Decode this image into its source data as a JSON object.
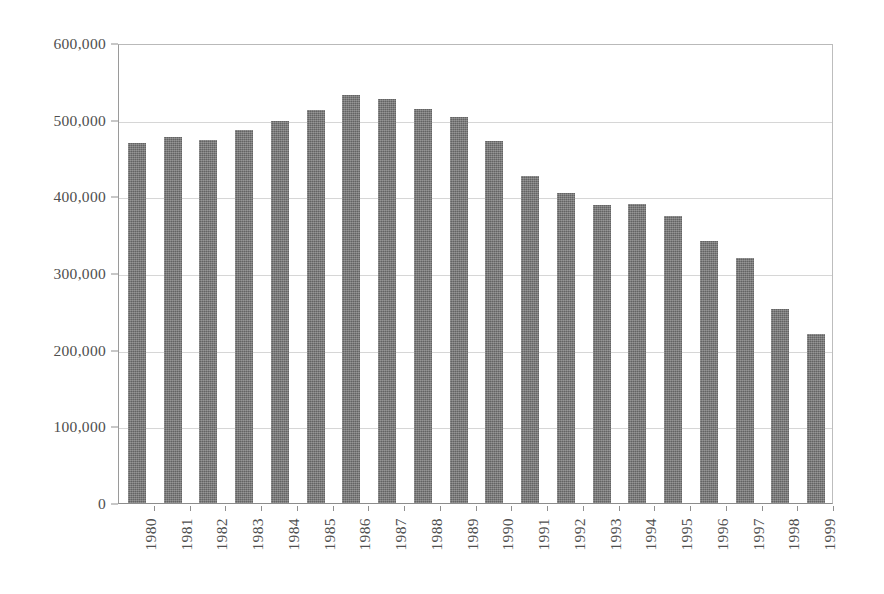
{
  "chart_data": {
    "type": "bar",
    "title": "",
    "subtitle": "",
    "xlabel": "",
    "ylabel": "",
    "categories": [
      "1980",
      "1981",
      "1982",
      "1983",
      "1984",
      "1985",
      "1986",
      "1987",
      "1988",
      "1989",
      "1990",
      "1991",
      "1992",
      "1993",
      "1994",
      "1995",
      "1996",
      "1997",
      "1998",
      "1999"
    ],
    "values": [
      470000,
      477000,
      474000,
      487000,
      498000,
      512000,
      532000,
      527000,
      514000,
      504000,
      472000,
      427000,
      405000,
      389000,
      390000,
      375000,
      342000,
      320000,
      253000,
      220000
    ],
    "ylim": [
      0,
      600000
    ],
    "ytick_values": [
      0,
      100000,
      200000,
      300000,
      400000,
      500000,
      600000
    ],
    "ytick_labels": [
      "0",
      "100,000",
      "200,000",
      "300,000",
      "400,000",
      "500,000",
      "600,000"
    ],
    "grid": true,
    "grid_axis": "y",
    "legend": null,
    "legend_position": "none",
    "series_color": "#6f6f6f",
    "plot_background": "#ffffff",
    "axis_color": "#8f8f8f",
    "gridline_color": "#d6d6d6",
    "bar_count": 20,
    "annotations": []
  },
  "figure": {
    "background": "#ffffff",
    "axes_frame": true
  }
}
